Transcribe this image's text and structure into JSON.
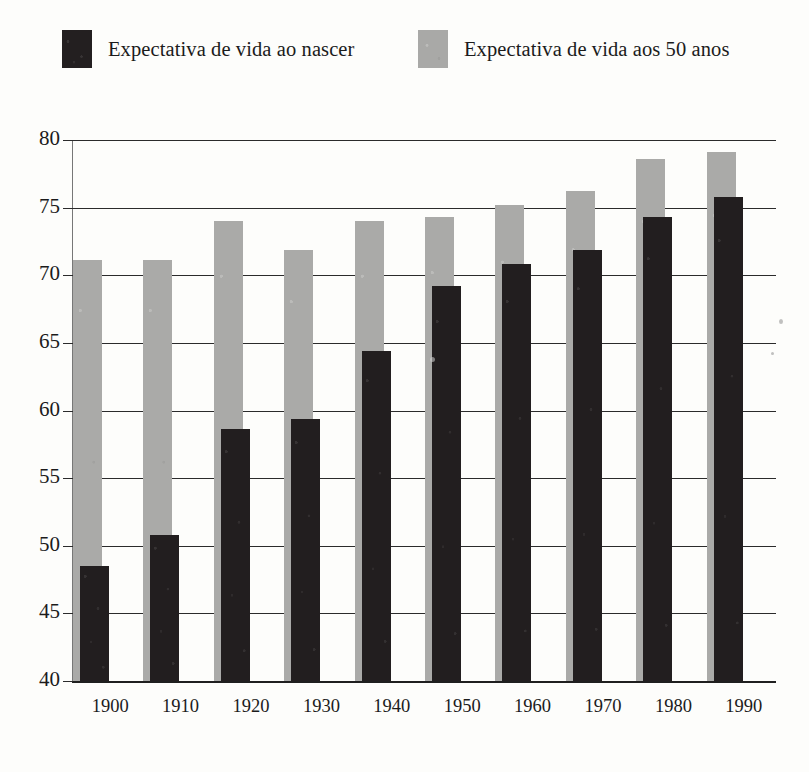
{
  "legend": {
    "entries": [
      {
        "label": "Expectativa de vida ao nascer",
        "swatch": "black-square-icon",
        "color": "#231f20"
      },
      {
        "label": "Expectativa de vida aos 50 anos",
        "swatch": "gray-square-icon",
        "color": "#a9a9a7"
      }
    ]
  },
  "chart_data": {
    "type": "bar",
    "title": "",
    "subtitle": "",
    "xlabel": "",
    "ylabel": "",
    "categories": [
      "1900",
      "1910",
      "1920",
      "1930",
      "1940",
      "1950",
      "1960",
      "1970",
      "1980",
      "1990"
    ],
    "series": [
      {
        "name": "Expectativa de vida ao nascer",
        "color": "#231f20",
        "values": [
          48.5,
          50.8,
          58.6,
          59.4,
          64.4,
          69.2,
          70.8,
          71.9,
          74.3,
          75.8
        ]
      },
      {
        "name": "Expectativa de vida aos 50 anos",
        "color": "#a9a9a7",
        "values": [
          71.1,
          71.1,
          74.0,
          71.9,
          74.0,
          74.3,
          75.2,
          76.2,
          78.6,
          79.1
        ]
      }
    ],
    "ylim": [
      40,
      80
    ],
    "ytick_labels": [
      "80",
      "75",
      "70",
      "65",
      "60",
      "55",
      "50",
      "45",
      "40"
    ],
    "yticks": [
      80,
      75,
      70,
      65,
      60,
      55,
      50,
      45,
      40
    ],
    "grid": true,
    "legend_position": "top",
    "bar_style": "overlapping-offset"
  }
}
